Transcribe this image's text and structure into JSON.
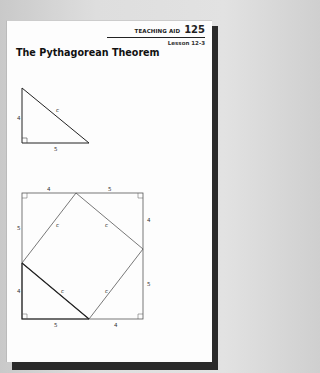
{
  "header": {
    "label": "TEACHING AID",
    "number": "125",
    "lesson": "Lesson 12-3"
  },
  "title": "The Pythagorean Theorem",
  "figure1": {
    "description": "Right triangle with legs 4 and 5 and hypotenuse c",
    "labels": {
      "vertical_leg": "4",
      "horizontal_leg": "5",
      "hypotenuse": "c"
    }
  },
  "figure2": {
    "description": "Square with sides 4+5 containing an inscribed tilted square of side c",
    "labels": {
      "top_left": "4",
      "top_right": "5",
      "left_upper": "5",
      "left_lower": "4",
      "right_upper": "4",
      "right_lower": "5",
      "bottom_left": "5",
      "bottom_right": "4",
      "inner_top_left": "c",
      "inner_top_right": "c",
      "inner_bottom_left": "c",
      "inner_bottom_right": "c"
    }
  },
  "colors": {
    "page": "#fdfdfd",
    "ink": "#222222",
    "shadow": "#2a2a2a",
    "background": "#dcdcdc"
  }
}
